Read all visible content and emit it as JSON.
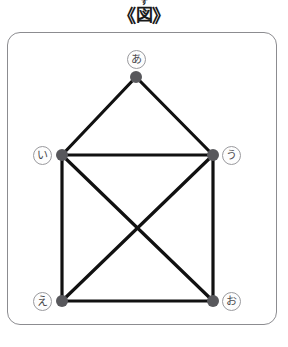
{
  "title": {
    "bracket_left": "《",
    "bracket_right": "》",
    "base": "図",
    "ruby": "ず"
  },
  "frame": {
    "border_color": "#8c8c90"
  },
  "graph": {
    "node_color": "#58585c",
    "edge_color": "#111111",
    "label_text_color": "#4a4a4e",
    "label_border_color": "#9a9a9e",
    "nodes": [
      {
        "id": "a",
        "label": "あ",
        "x": 136,
        "y": 77,
        "label_x": 127,
        "label_y": 50
      },
      {
        "id": "i",
        "label": "い",
        "x": 62,
        "y": 155,
        "label_x": 33,
        "label_y": 146
      },
      {
        "id": "u",
        "label": "う",
        "x": 213,
        "y": 155,
        "label_x": 222,
        "label_y": 146
      },
      {
        "id": "e",
        "label": "え",
        "x": 62,
        "y": 301,
        "label_x": 33,
        "label_y": 292
      },
      {
        "id": "o",
        "label": "お",
        "x": 213,
        "y": 301,
        "label_x": 222,
        "label_y": 292
      }
    ],
    "edges": [
      {
        "from": "a",
        "to": "i"
      },
      {
        "from": "a",
        "to": "u"
      },
      {
        "from": "i",
        "to": "u"
      },
      {
        "from": "i",
        "to": "e"
      },
      {
        "from": "i",
        "to": "o"
      },
      {
        "from": "u",
        "to": "e"
      },
      {
        "from": "u",
        "to": "o"
      },
      {
        "from": "e",
        "to": "o"
      }
    ]
  }
}
